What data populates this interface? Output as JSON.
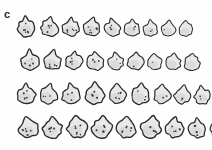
{
  "panel": {
    "label": "c",
    "caption_text": "",
    "background_color": "#fefefe",
    "width_px": 212,
    "height_px": 150
  },
  "figure": {
    "type": "specimen-outline-array",
    "outline_color": "#2a2a2a",
    "fill_color": "#e9e9e9",
    "dot_color": "#3a3a3a",
    "total_specimens": 36,
    "row_count": 4,
    "columns_per_row": 9,
    "rows": [
      {
        "row_index": 1,
        "row_label": "",
        "top_px": 10,
        "left_px": 14,
        "count": 9,
        "specimens": [
          {
            "id": "r1c1",
            "w": 25,
            "h": 25,
            "dots": 6,
            "rot": -6
          },
          {
            "id": "r1c2",
            "w": 23,
            "h": 24,
            "dots": 4,
            "rot": 4
          },
          {
            "id": "r1c3",
            "w": 22,
            "h": 24,
            "dots": 5,
            "rot": -3
          },
          {
            "id": "r1c4",
            "w": 22,
            "h": 24,
            "dots": 6,
            "rot": 2
          },
          {
            "id": "r1c5",
            "w": 21,
            "h": 23,
            "dots": 3,
            "rot": -4
          },
          {
            "id": "r1c6",
            "w": 20,
            "h": 22,
            "dots": 3,
            "rot": 5
          },
          {
            "id": "r1c7",
            "w": 19,
            "h": 22,
            "dots": 2,
            "rot": -2
          },
          {
            "id": "r1c8",
            "w": 19,
            "h": 21,
            "dots": 1,
            "rot": 3
          },
          {
            "id": "r1c9",
            "w": 18,
            "h": 21,
            "dots": 0,
            "rot": -5
          }
        ]
      },
      {
        "row_index": 2,
        "row_label": "",
        "top_px": 44,
        "left_px": 18,
        "count": 9,
        "specimens": [
          {
            "id": "r2c1",
            "w": 24,
            "h": 25,
            "dots": 4,
            "rot": -5
          },
          {
            "id": "r2c2",
            "w": 23,
            "h": 25,
            "dots": 4,
            "rot": 3
          },
          {
            "id": "r2c3",
            "w": 22,
            "h": 25,
            "dots": 4,
            "rot": -3
          },
          {
            "id": "r2c4",
            "w": 22,
            "h": 24,
            "dots": 3,
            "rot": 4
          },
          {
            "id": "r2c5",
            "w": 21,
            "h": 24,
            "dots": 2,
            "rot": -2
          },
          {
            "id": "r2c6",
            "w": 21,
            "h": 24,
            "dots": 1,
            "rot": 5
          },
          {
            "id": "r2c7",
            "w": 19,
            "h": 23,
            "dots": 1,
            "rot": -4
          },
          {
            "id": "r2c8",
            "w": 20,
            "h": 23,
            "dots": 0,
            "rot": 2
          },
          {
            "id": "r2c9",
            "w": 20,
            "h": 22,
            "dots": 0,
            "rot": -3
          }
        ]
      },
      {
        "row_index": 3,
        "row_label": "",
        "top_px": 78,
        "left_px": 14,
        "count": 9,
        "specimens": [
          {
            "id": "r3c1",
            "w": 24,
            "h": 26,
            "dots": 4,
            "rot": -6
          },
          {
            "id": "r3c2",
            "w": 23,
            "h": 26,
            "dots": 3,
            "rot": 3
          },
          {
            "id": "r3c3",
            "w": 24,
            "h": 26,
            "dots": 3,
            "rot": -2
          },
          {
            "id": "r3c4",
            "w": 25,
            "h": 27,
            "dots": 5,
            "rot": 4
          },
          {
            "id": "r3c5",
            "w": 23,
            "h": 26,
            "dots": 4,
            "rot": -3
          },
          {
            "id": "r3c6",
            "w": 24,
            "h": 26,
            "dots": 3,
            "rot": 5
          },
          {
            "id": "r3c7",
            "w": 22,
            "h": 25,
            "dots": 2,
            "rot": -4
          },
          {
            "id": "r3c8",
            "w": 21,
            "h": 25,
            "dots": 2,
            "rot": 2
          },
          {
            "id": "r3c9",
            "w": 21,
            "h": 24,
            "dots": 2,
            "rot": -3
          }
        ]
      },
      {
        "row_index": 4,
        "row_label": "",
        "top_px": 112,
        "left_px": 16,
        "count": 9,
        "specimens": [
          {
            "id": "r4c1",
            "w": 25,
            "h": 27,
            "dots": 6,
            "rot": -5
          },
          {
            "id": "r4c2",
            "w": 25,
            "h": 27,
            "dots": 5,
            "rot": 3
          },
          {
            "id": "r4c3",
            "w": 26,
            "h": 28,
            "dots": 6,
            "rot": -3
          },
          {
            "id": "r4c4",
            "w": 26,
            "h": 28,
            "dots": 5,
            "rot": 4
          },
          {
            "id": "r4c5",
            "w": 25,
            "h": 27,
            "dots": 6,
            "rot": -2
          },
          {
            "id": "r4c6",
            "w": 26,
            "h": 28,
            "dots": 4,
            "rot": 5
          },
          {
            "id": "r4c7",
            "w": 24,
            "h": 27,
            "dots": 4,
            "rot": -4
          },
          {
            "id": "r4c8",
            "w": 23,
            "h": 26,
            "dots": 5,
            "rot": 2
          },
          {
            "id": "r4c9",
            "w": 22,
            "h": 26,
            "dots": 4,
            "rot": -3
          }
        ]
      }
    ]
  }
}
